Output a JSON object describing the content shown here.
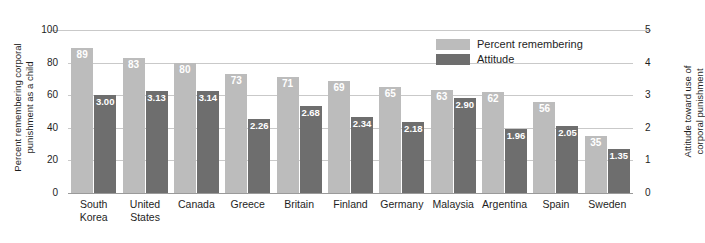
{
  "chart_data": {
    "type": "bar",
    "title": "",
    "subtitle": "",
    "categories": [
      "South\nKorea",
      "United\nStates",
      "Canada",
      "Greece",
      "Britain",
      "Finland",
      "Germany",
      "Malaysia",
      "Argentina",
      "Spain",
      "Sweden"
    ],
    "category_labels": [
      [
        "South",
        "Korea"
      ],
      [
        "United",
        "States"
      ],
      [
        "Canada"
      ],
      [
        "Greece"
      ],
      [
        "Britain"
      ],
      [
        "Finland"
      ],
      [
        "Germany"
      ],
      [
        "Malaysia"
      ],
      [
        "Argentina"
      ],
      [
        "Spain"
      ],
      [
        "Sweden"
      ]
    ],
    "series": [
      {
        "name": "Percent remembering",
        "axis": "left",
        "color": "#bcbcbc",
        "values": [
          89,
          83,
          80,
          73,
          71,
          69,
          65,
          63,
          62,
          56,
          35
        ],
        "labels": [
          "89",
          "83",
          "80",
          "73",
          "71",
          "69",
          "65",
          "63",
          "62",
          "56",
          "35"
        ]
      },
      {
        "name": "Attitude",
        "axis": "right",
        "color": "#6e6e6e",
        "values": [
          3.0,
          3.13,
          3.14,
          2.26,
          2.68,
          2.34,
          2.18,
          2.9,
          1.96,
          2.05,
          1.35
        ],
        "labels": [
          "3.00",
          "3.13",
          "3.14",
          "2.26",
          "2.68",
          "2.34",
          "2.18",
          "2.90",
          "1.96",
          "2.05",
          "1.35"
        ]
      }
    ],
    "xlabel": "",
    "ylabel": "Percent remembering corporal punishment as a child",
    "y2label": "Attitude toward use of corporal punishment",
    "ylim": [
      0,
      100
    ],
    "y2lim": [
      0,
      5
    ],
    "yticks": [
      "0",
      "20",
      "40",
      "60",
      "80",
      "100"
    ],
    "y2ticks": [
      "0",
      "1",
      "2",
      "3",
      "4",
      "5"
    ],
    "grid": true,
    "legend_position": "top-right"
  },
  "axes": {
    "left_title_lines": [
      "Percent remembering corporal",
      "punishment as a child"
    ],
    "right_title_lines": [
      "Attitude toward use of",
      "corporal punishment"
    ],
    "left_ticks": [
      {
        "label": "100",
        "value": 100
      },
      {
        "label": "80",
        "value": 80
      },
      {
        "label": "60",
        "value": 60
      },
      {
        "label": "40",
        "value": 40
      },
      {
        "label": "20",
        "value": 20
      },
      {
        "label": "0",
        "value": 0
      }
    ],
    "right_ticks": [
      {
        "label": "5",
        "value": 5
      },
      {
        "label": "4",
        "value": 4
      },
      {
        "label": "3",
        "value": 3
      },
      {
        "label": "2",
        "value": 2
      },
      {
        "label": "1",
        "value": 1
      },
      {
        "label": "0",
        "value": 0
      }
    ]
  },
  "legend": {
    "items": [
      {
        "label": "Percent remembering",
        "color": "#bcbcbc",
        "swatch": "light"
      },
      {
        "label": "Attitude",
        "color": "#6e6e6e",
        "swatch": "dark"
      }
    ]
  },
  "colors": {
    "light_bar": "#bcbcbc",
    "dark_bar": "#6e6e6e",
    "gridline": "#c9c9c9",
    "baseline": "#9a9a9a",
    "text": "#1e1e1e",
    "background": "#ffffff"
  }
}
